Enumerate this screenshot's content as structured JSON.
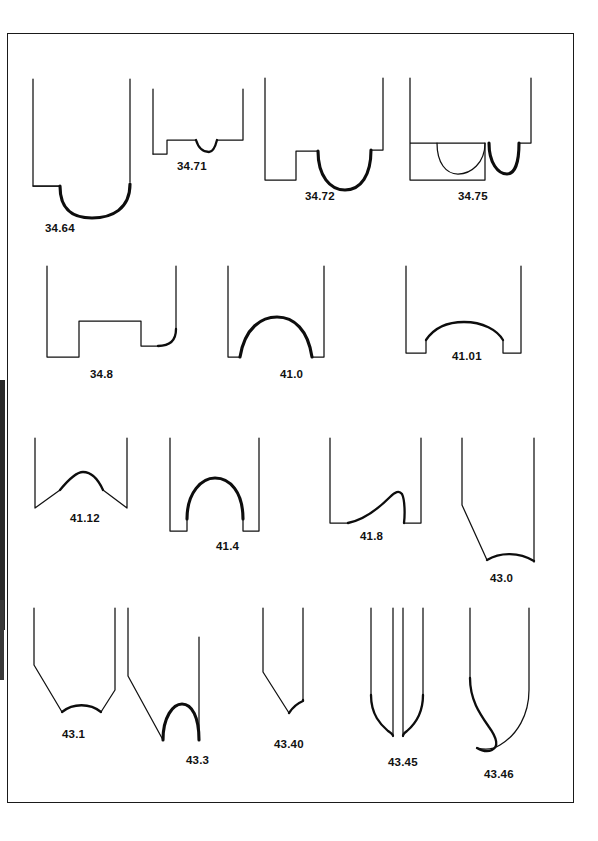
{
  "plate": {
    "title": "Vessel base profile typology plate",
    "border_color": "#1a1a1a",
    "ink_color": "#111111",
    "background": "#ffffff"
  },
  "rows": [
    {
      "row_index": 1,
      "items": [
        {
          "code": "34.64",
          "label_x": 45,
          "label_y": 222,
          "description": "straight walls, narrow ledge foot at left, deep U-shaped rounded base"
        },
        {
          "code": "34.71",
          "label_x": 177,
          "label_y": 160,
          "description": "low stepped foot, flat base with small central dimple"
        },
        {
          "code": "34.72",
          "label_x": 305,
          "label_y": 190,
          "description": "stepped ring feet with broad U-shaped hollow between"
        },
        {
          "code": "34.75",
          "label_x": 458,
          "label_y": 190,
          "description": "double scalloped base, ghost outline on left hollow"
        }
      ]
    },
    {
      "row_index": 2,
      "items": [
        {
          "code": "34.8",
          "label_x": 90,
          "label_y": 368,
          "description": "stepped plateau foot with concave sweep to right wall"
        },
        {
          "code": "41.0",
          "label_x": 280,
          "label_y": 368,
          "description": "tall rounded omphalos dome base"
        },
        {
          "code": "41.01",
          "label_x": 452,
          "label_y": 350,
          "description": "low flattened dome between short feet"
        }
      ]
    },
    {
      "row_index": 3,
      "items": [
        {
          "code": "41.12",
          "label_x": 70,
          "label_y": 512,
          "description": "angled walls with low rounded central peak"
        },
        {
          "code": "41.4",
          "label_x": 216,
          "label_y": 540,
          "description": "tall semicircular dome with short feet"
        },
        {
          "code": "41.8",
          "label_x": 360,
          "label_y": 530,
          "description": "asymmetric dome, gentle left rise, steep right fall"
        },
        {
          "code": "43.0",
          "label_x": 490,
          "label_y": 572,
          "description": "diagonal left wall with shallow concave base"
        }
      ]
    },
    {
      "row_index": 4,
      "items": [
        {
          "code": "43.1",
          "label_x": 62,
          "label_y": 728,
          "description": "tapering walls with shallow concave base"
        },
        {
          "code": "43.3",
          "label_x": 186,
          "label_y": 754,
          "description": "diagonal left wall with deep arched dome base"
        },
        {
          "code": "43.40",
          "label_x": 274,
          "label_y": 738,
          "description": "angled left wall sweeping to flat thickened base"
        },
        {
          "code": "43.45",
          "label_x": 388,
          "label_y": 756,
          "description": "paired pointed prongs with S-curved walls"
        },
        {
          "code": "43.46",
          "label_x": 484,
          "label_y": 768,
          "description": "S-curved wall terminating in hooked point"
        }
      ]
    }
  ],
  "icons": {
    "profile": "vessel-profile-icon"
  }
}
